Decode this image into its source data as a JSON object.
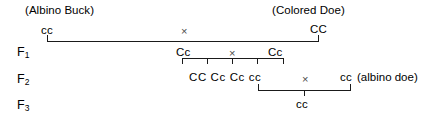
{
  "diagram": {
    "cross_symbol": "×",
    "parents": {
      "left_caption": "(Albino Buck)",
      "left_genotype": "cc",
      "right_caption": "(Colored Doe)",
      "right_genotype": "CC"
    },
    "generations": [
      {
        "label": "F",
        "subscript": "1"
      },
      {
        "label": "F",
        "subscript": "2"
      },
      {
        "label": "F",
        "subscript": "3"
      }
    ],
    "f1": {
      "left_genotype": "Cc",
      "right_genotype": "Cc"
    },
    "f2": {
      "offspring": [
        "CC",
        "Cc",
        "Cc",
        "cc"
      ],
      "offspring_text": "CC Cc Cc  cc",
      "testcross_left": "cc",
      "testcross_right": "cc",
      "testcross_right_note": "(albino doe)"
    },
    "f3": {
      "offspring": "cc"
    }
  }
}
